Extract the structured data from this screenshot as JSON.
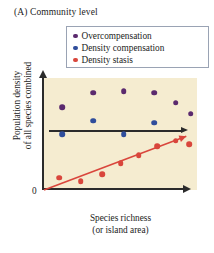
{
  "panel": {
    "title": "(A)  Community level"
  },
  "legend": {
    "position": "top-right",
    "items": [
      {
        "label": "Overcompensation",
        "color": "#5b2a6e",
        "icon": "legend-dot-icon"
      },
      {
        "label": "Density compensation",
        "color": "#2f4d9b",
        "icon": "legend-dot-icon"
      },
      {
        "label": "Density stasis",
        "color": "#d9463c",
        "icon": "legend-dot-icon"
      }
    ]
  },
  "axes": {
    "ylabel_line1": "Population density",
    "ylabel_line2": "of all species combined",
    "xlabel_line1": "Species richness",
    "xlabel_line2": "(or island area)",
    "origin": "0",
    "plot_background": "#f5ecd0",
    "axis_color": "#2b2b2b"
  },
  "chart_data": {
    "type": "scatter",
    "title": "(A)  Community level",
    "xlabel": "Species richness (or island area)",
    "ylabel": "Population density of all species combined",
    "xlim": [
      0,
      1
    ],
    "ylim": [
      0,
      1
    ],
    "grid": false,
    "legend_position": "top-right",
    "axis_ticks": "none",
    "series": [
      {
        "name": "Overcompensation",
        "color": "#5b2a6e",
        "points": [
          {
            "x": 0.12,
            "y": 0.74
          },
          {
            "x": 0.32,
            "y": 0.87
          },
          {
            "x": 0.52,
            "y": 0.88
          },
          {
            "x": 0.72,
            "y": 0.87
          },
          {
            "x": 0.86,
            "y": 0.78
          },
          {
            "x": 0.96,
            "y": 0.68
          }
        ]
      },
      {
        "name": "Density compensation",
        "color": "#2f4d9b",
        "points": [
          {
            "x": 0.12,
            "y": 0.5
          },
          {
            "x": 0.32,
            "y": 0.62
          },
          {
            "x": 0.52,
            "y": 0.5
          },
          {
            "x": 0.72,
            "y": 0.6
          }
        ]
      },
      {
        "name": "Density stasis",
        "color": "#d9463c",
        "points": [
          {
            "x": 0.1,
            "y": 0.11
          },
          {
            "x": 0.24,
            "y": 0.08
          },
          {
            "x": 0.38,
            "y": 0.14
          },
          {
            "x": 0.5,
            "y": 0.24
          },
          {
            "x": 0.62,
            "y": 0.31
          },
          {
            "x": 0.74,
            "y": 0.39
          },
          {
            "x": 0.86,
            "y": 0.44
          },
          {
            "x": 0.95,
            "y": 0.41
          }
        ]
      }
    ],
    "trendlines": [
      {
        "name": "density-compensation-flat-trend",
        "color": "#2b2b2b",
        "arrow": true,
        "x0": 0.04,
        "y0": 0.53,
        "x1": 0.98,
        "y1": 0.53
      },
      {
        "name": "density-stasis-rising-trend",
        "color": "#d9463c",
        "arrow": true,
        "x0": 0.0,
        "y0": 0.0,
        "x1": 0.93,
        "y1": 0.48
      }
    ]
  }
}
